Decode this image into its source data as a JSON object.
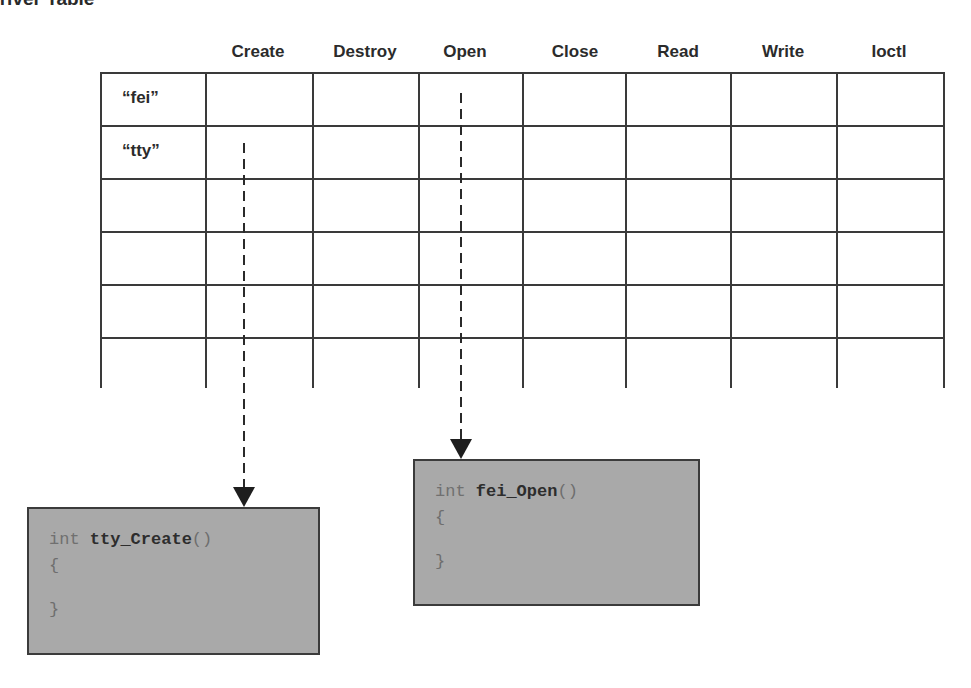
{
  "title": "Driver Table",
  "table": {
    "columns": [
      "Create",
      "Destroy",
      "Open",
      "Close",
      "Read",
      "Write",
      "Ioctl"
    ],
    "rows": [
      {
        "label": "“fei”"
      },
      {
        "label": "“tty”"
      },
      {
        "label": ""
      },
      {
        "label": ""
      },
      {
        "label": ""
      },
      {
        "label": ""
      }
    ]
  },
  "code_boxes": [
    {
      "keyword": "int",
      "name": "tty_Create",
      "parens": "()",
      "open_brace": "{",
      "close_brace": "}",
      "linked_row": "“tty”",
      "linked_column": "Create"
    },
    {
      "keyword": "int",
      "name": "fei_Open",
      "parens": "()",
      "open_brace": "{",
      "close_brace": "}",
      "linked_row": "“fei”",
      "linked_column": "Open"
    }
  ],
  "colors": {
    "line": "#3a3a3a",
    "box_fill": "#a9a9a9",
    "arrow": "#1e1e1e"
  }
}
